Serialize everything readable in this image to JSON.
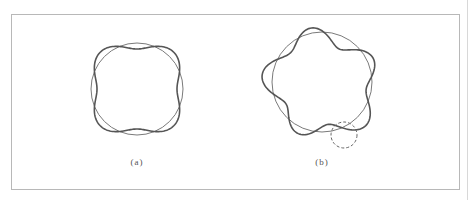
{
  "figure": {
    "panels": [
      {
        "id": "a",
        "label": "(a)",
        "label_pos": [
          137,
          163
        ],
        "reference_circle": {
          "cx": 137,
          "cy": 89,
          "r": 46
        },
        "deformed_curve": {
          "cx": 137,
          "cy": 89,
          "r": 46,
          "mode": 4,
          "amplitude": -6,
          "phase_deg": 0,
          "irregularity": 0
        },
        "highlight_circle": null
      },
      {
        "id": "b",
        "label": "(b)",
        "label_pos": [
          322,
          163
        ],
        "reference_circle": {
          "cx": 322,
          "cy": 82,
          "r": 50
        },
        "deformed_curve": {
          "cx": 322,
          "cy": 84,
          "r": 50,
          "mode": 5,
          "amplitude": 8,
          "phase_deg": -100,
          "irregularity": 3
        },
        "highlight_circle": {
          "cx": 344,
          "cy": 135,
          "r": 13,
          "style": "dashed"
        }
      }
    ]
  },
  "colors": {
    "frame": "#b8b8b8",
    "reference_circle": "#7a7a7a",
    "deformed_curve": "#555555",
    "dashed_circle": "#666666",
    "label": "#555555"
  }
}
